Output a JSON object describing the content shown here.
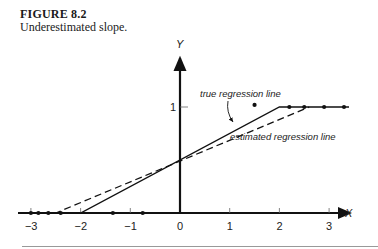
{
  "figure": {
    "label": "FIGURE 8.2",
    "caption": "Underestimated slope."
  },
  "chart_data": {
    "type": "scatter",
    "title": "Underestimated slope.",
    "xlabel": "X",
    "ylabel": "Y",
    "x_ticks": [
      -3,
      -2,
      -1,
      0,
      1,
      2,
      3
    ],
    "x_tick_labels": [
      "-3",
      "-2",
      "-1",
      "0",
      "1",
      "2",
      "3"
    ],
    "y_ticks": [
      1
    ],
    "y_tick_labels": [
      "1"
    ],
    "xlim": [
      -3.3,
      3.5
    ],
    "ylim": [
      0,
      1.6
    ],
    "grid": false,
    "series": [
      {
        "name": "data points",
        "type": "scatter",
        "points": [
          {
            "x": -3.0,
            "y": 0
          },
          {
            "x": -2.85,
            "y": 0
          },
          {
            "x": -2.65,
            "y": 0
          },
          {
            "x": -2.4,
            "y": 0
          },
          {
            "x": -1.35,
            "y": 0
          },
          {
            "x": -0.75,
            "y": 0
          },
          {
            "x": 1.5,
            "y": 1.02
          },
          {
            "x": 2.2,
            "y": 1
          },
          {
            "x": 2.5,
            "y": 1
          },
          {
            "x": 2.9,
            "y": 1
          },
          {
            "x": 3.3,
            "y": 1
          }
        ]
      },
      {
        "name": "true regression line",
        "type": "line",
        "style": "solid",
        "points": [
          {
            "x": -3.2,
            "y": 0
          },
          {
            "x": -2.0,
            "y": 0
          },
          {
            "x": 2.0,
            "y": 1
          },
          {
            "x": 3.4,
            "y": 1
          }
        ]
      },
      {
        "name": "estimated regression line",
        "type": "line",
        "style": "dashed",
        "points": [
          {
            "x": -3.2,
            "y": 0
          },
          {
            "x": -2.5,
            "y": 0
          },
          {
            "x": 2.6,
            "y": 1
          }
        ]
      }
    ],
    "annotations": [
      {
        "text": "true regression line",
        "x": 0.4,
        "y": 1.15,
        "arrow_to": {
          "x": 1.0,
          "y": 0.75
        }
      },
      {
        "text": "estimated regression line",
        "x": 1.0,
        "y": 0.62
      }
    ]
  }
}
